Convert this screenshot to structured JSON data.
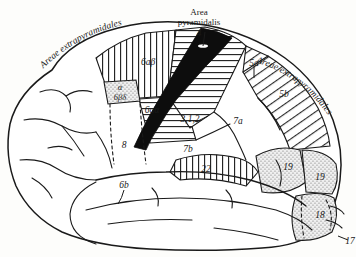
{
  "figure": {
    "title_left": "Areae extrapyramidales",
    "title_right": "Areae extrapyramidales",
    "title_center_line1": "Area",
    "title_center_line2": "pyramidalis",
    "background_color": "#fdfdfb",
    "ink_color": "#1a1a1a"
  },
  "areas": [
    {
      "id": "4",
      "label": "4",
      "pattern": "solid-black",
      "region": "precentral-gyrus"
    },
    {
      "id": "6abeta",
      "label": "6aβ",
      "pattern": "vertical-hatch",
      "region": "superior-frontal"
    },
    {
      "id": "6aalpha",
      "label": "6aα",
      "pattern": "horizontal-hatch",
      "region": "mid-precentral"
    },
    {
      "id": "6bdelta",
      "label": "6βδ",
      "pattern": "stipple",
      "region": "inferior-precentral"
    },
    {
      "id": "alpha",
      "label": "α",
      "pattern": "stipple",
      "region": "inferior-precentral"
    },
    {
      "id": "6b",
      "label": "6b",
      "pattern": "none",
      "region": "opercular"
    },
    {
      "id": "8",
      "label": "8",
      "pattern": "none",
      "region": "frontal-eye-field"
    },
    {
      "id": "312",
      "label": "3,1,2",
      "pattern": "horizontal-hatch",
      "region": "postcentral-gyrus"
    },
    {
      "id": "5a",
      "label": "5a",
      "pattern": "diagonal-hatch",
      "region": "superior-parietal"
    },
    {
      "id": "5b",
      "label": "5b",
      "pattern": "diagonal-hatch",
      "region": "superior-parietal"
    },
    {
      "id": "7a",
      "label": "7a",
      "pattern": "none",
      "region": "inferior-parietal"
    },
    {
      "id": "7b",
      "label": "7b",
      "pattern": "none",
      "region": "supramarginal"
    },
    {
      "id": "22",
      "label": "22",
      "pattern": "vertical-hatch",
      "region": "superior-temporal"
    },
    {
      "id": "19a",
      "label": "19",
      "pattern": "stipple",
      "region": "occipital"
    },
    {
      "id": "19b",
      "label": "19",
      "pattern": "stipple",
      "region": "occipital"
    },
    {
      "id": "18",
      "label": "18",
      "pattern": "stipple",
      "region": "occipital"
    },
    {
      "id": "17",
      "label": "17",
      "pattern": "none",
      "region": "occipital-pole"
    }
  ]
}
